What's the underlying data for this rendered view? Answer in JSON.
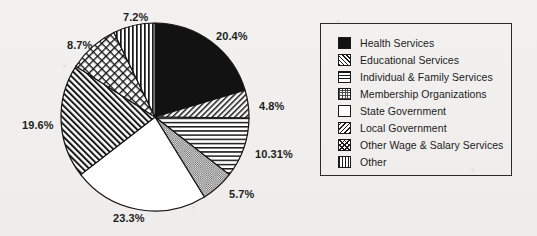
{
  "chart_data": {
    "type": "pie",
    "title": "",
    "legend_position": "right",
    "start_angle_deg": 0,
    "direction": "clockwise",
    "categories": [
      "Health Services",
      "Educational Services",
      "Individual & Family Services",
      "Membership Organizations",
      "State Government",
      "Local Government",
      "Other Wage & Salary Services",
      "Other"
    ],
    "values": [
      20.4,
      4.8,
      10.31,
      5.7,
      23.3,
      19.6,
      8.7,
      7.2
    ],
    "labels": [
      "20.4%",
      "4.8%",
      "10.31%",
      "5.7%",
      "23.3%",
      "19.6%",
      "8.7%",
      "7.2%"
    ],
    "patterns": [
      "solid-black",
      "diagonal-right",
      "horizontal-lines",
      "fine-dots",
      "white",
      "diagonal-left",
      "cross-hatch",
      "vertical-lines"
    ]
  },
  "legend": {
    "items": [
      {
        "label": "Health Services",
        "pattern": "fill-solid"
      },
      {
        "label": "Educational Services",
        "pattern": "fill-diag-right"
      },
      {
        "label": "Individual & Family Services",
        "pattern": "fill-horiz"
      },
      {
        "label": "Membership Organizations",
        "pattern": "fill-dots"
      },
      {
        "label": "State Government",
        "pattern": "fill-white"
      },
      {
        "label": "Local Government",
        "pattern": "fill-diag-left"
      },
      {
        "label": "Other Wage & Salary Services",
        "pattern": "fill-cross"
      },
      {
        "label": "Other",
        "pattern": "fill-vert"
      }
    ]
  },
  "pie_labels": [
    {
      "text": "20.4%",
      "x": 216,
      "y": 30
    },
    {
      "text": "4.8%",
      "x": 259,
      "y": 100
    },
    {
      "text": "10.31%",
      "x": 255,
      "y": 148
    },
    {
      "text": "5.7%",
      "x": 229,
      "y": 188
    },
    {
      "text": "23.3%",
      "x": 113,
      "y": 212
    },
    {
      "text": "19.6%",
      "x": 22,
      "y": 119
    },
    {
      "text": "8.7%",
      "x": 67,
      "y": 39
    },
    {
      "text": "7.2%",
      "x": 123,
      "y": 11
    }
  ],
  "geometry": {
    "cx": 155,
    "cy": 117,
    "r": 94
  }
}
